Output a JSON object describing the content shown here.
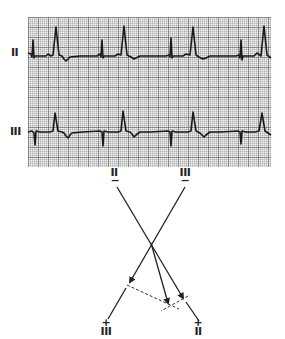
{
  "ecg": {
    "leads": [
      {
        "label": "II"
      },
      {
        "label": "III"
      }
    ]
  },
  "axis_diagram": {
    "top_labels": [
      {
        "lead": "II",
        "polarity": "−"
      },
      {
        "lead": "III",
        "polarity": "−"
      }
    ],
    "bottom_labels": [
      {
        "lead": "III",
        "polarity": "+"
      },
      {
        "lead": "II",
        "polarity": "+"
      }
    ]
  },
  "colors": {
    "trace": "#1a1a1a",
    "grid_bg": "#f2f2f2",
    "grid_line": "#8c8c8c"
  }
}
